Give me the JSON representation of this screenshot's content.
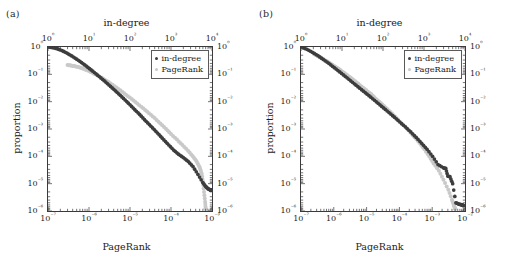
{
  "figure": {
    "background": "#ffffff",
    "series_colors": {
      "in_degree": "#3d3d3d",
      "pagerank": "#c9c9c9"
    }
  },
  "panels": [
    {
      "tag": "(a)",
      "axes": {
        "top_title": "in-degree",
        "bottom_title": "PageRank",
        "left_title": "proportion",
        "xtop_ticks": [
          "10⁰",
          "10¹",
          "10²",
          "10³",
          "10⁴"
        ],
        "xtop_exponents": [
          0,
          1,
          2,
          3,
          4
        ],
        "xbot_ticks": [
          "10⁻⁷",
          "10⁻⁶",
          "10⁻⁵",
          "10⁻⁴",
          "10⁻³"
        ],
        "xbot_exponents": [
          -7,
          -6,
          -5,
          -4,
          -3
        ],
        "y_ticks": [
          "10⁰",
          "10⁻¹",
          "10⁻²",
          "10⁻³",
          "10⁻⁴",
          "10⁻⁵",
          "10⁻⁶"
        ],
        "y_exponents": [
          0,
          -1,
          -2,
          -3,
          -4,
          -5,
          -6
        ]
      },
      "legend": {
        "items": [
          {
            "label": "in-degree",
            "color": "#3d3d3d"
          },
          {
            "label": "PageRank",
            "color": "#c9c9c9"
          }
        ]
      }
    },
    {
      "tag": "(b)",
      "axes": {
        "top_title": "in-degree",
        "bottom_title": "PageRank",
        "left_title": "proportion",
        "xtop_ticks": [
          "10⁰",
          "10¹",
          "10²",
          "10³",
          "10⁴"
        ],
        "xtop_exponents": [
          0,
          1,
          2,
          3,
          4
        ],
        "xbot_ticks": [
          "10⁻⁷",
          "10⁻⁶",
          "10⁻⁵",
          "10⁻⁴",
          "10⁻³",
          "10⁻²"
        ],
        "xbot_exponents": [
          -7,
          -6,
          -5,
          -4,
          -3,
          -2
        ],
        "y_ticks": [
          "10⁰",
          "10⁻¹",
          "10⁻²",
          "10⁻³",
          "10⁻⁴",
          "10⁻⁵",
          "10⁻⁶"
        ],
        "y_exponents": [
          0,
          -1,
          -2,
          -3,
          -4,
          -5,
          -6
        ]
      },
      "legend": {
        "items": [
          {
            "label": "in-degree",
            "color": "#3d3d3d"
          },
          {
            "label": "PageRank",
            "color": "#c9c9c9"
          }
        ]
      }
    }
  ],
  "chart_data": [
    {
      "type": "scatter",
      "panel": "(a)",
      "title": "",
      "xlabel": "PageRank",
      "xlabel_top": "in-degree",
      "ylabel": "proportion",
      "xscale": "log",
      "yscale": "log",
      "grid": false,
      "legend_position": "top-right",
      "xlim_top": [
        1,
        10000
      ],
      "xlim_bottom": [
        1e-07,
        0.001
      ],
      "ylim": [
        1e-06,
        1
      ],
      "series": [
        {
          "name": "in-degree",
          "color": "#3d3d3d",
          "axis": "top",
          "x": [
            1,
            1.3,
            1.7,
            2.2,
            2.9,
            3.8,
            5,
            6.6,
            8.6,
            11.3,
            14.8,
            19.5,
            25.6,
            33.6,
            44.1,
            58,
            76.1,
            100,
            131,
            172,
            226,
            297,
            390,
            512,
            672,
            883,
            1160,
            1523,
            2000,
            2627,
            3450,
            4530,
            5950,
            7000,
            8000,
            9000,
            9500
          ],
          "y": [
            1.0,
            0.95,
            0.86,
            0.74,
            0.6,
            0.47,
            0.36,
            0.27,
            0.2,
            0.145,
            0.105,
            0.074,
            0.052,
            0.036,
            0.025,
            0.017,
            0.0115,
            0.0077,
            0.0051,
            0.0034,
            0.0022,
            0.00145,
            0.00095,
            0.00062,
            0.0004,
            0.00026,
            0.00017,
            0.00012,
            9e-05,
            6.5e-05,
            4.2e-05,
            2.2e-05,
            1.1e-05,
            8e-06,
            6.5e-06,
            6e-06,
            5.8e-06
          ]
        },
        {
          "name": "PageRank",
          "color": "#c9c9c9",
          "axis": "bottom",
          "x": [
            3e-07,
            3.6e-07,
            4.4e-07,
            5.5e-07,
            7e-07,
            9e-07,
            1.2e-06,
            1.6e-06,
            2.2e-06,
            3e-06,
            4.2e-06,
            5.8e-06,
            8e-06,
            1.1e-05,
            1.5e-05,
            2.1e-05,
            2.9e-05,
            4e-05,
            5.5e-05,
            7.5e-05,
            0.0001,
            0.00014,
            0.00019,
            0.00026,
            0.00034,
            0.00042,
            0.0005,
            0.00056,
            0.0006,
            0.00064,
            0.00068,
            0.0007
          ],
          "y": [
            0.22,
            0.21,
            0.2,
            0.185,
            0.165,
            0.14,
            0.115,
            0.09,
            0.07,
            0.052,
            0.037,
            0.026,
            0.018,
            0.0125,
            0.0085,
            0.0057,
            0.0038,
            0.0025,
            0.0016,
            0.00102,
            0.00065,
            0.00041,
            0.00026,
            0.00016,
            0.0001,
            6.6e-05,
            4e-05,
            2.3e-05,
            1.2e-05,
            5e-06,
            2.2e-06,
            1.2e-06
          ]
        }
      ]
    },
    {
      "type": "scatter",
      "panel": "(b)",
      "title": "",
      "xlabel": "PageRank",
      "xlabel_top": "in-degree",
      "ylabel": "proportion",
      "xscale": "log",
      "yscale": "log",
      "grid": false,
      "legend_position": "top-right",
      "xlim_top": [
        1,
        10000
      ],
      "xlim_bottom": [
        1e-07,
        0.01
      ],
      "ylim": [
        1e-06,
        1
      ],
      "series": [
        {
          "name": "in-degree",
          "color": "#3d3d3d",
          "axis": "top",
          "x": [
            1,
            1.4,
            1.9,
            2.6,
            3.5,
            4.8,
            6.5,
            8.8,
            12,
            16.3,
            22,
            30,
            41,
            56,
            76,
            103,
            140,
            190,
            258,
            350,
            476,
            646,
            878,
            1193,
            1620,
            2200,
            2990,
            3400,
            3800,
            4300,
            5000,
            6000,
            7000,
            8000,
            9000
          ],
          "y": [
            1.0,
            0.82,
            0.64,
            0.48,
            0.35,
            0.25,
            0.175,
            0.122,
            0.084,
            0.058,
            0.04,
            0.0275,
            0.0188,
            0.0128,
            0.0087,
            0.0059,
            0.004,
            0.0027,
            0.0018,
            0.0012,
            0.00078,
            0.00049,
            0.0003,
            0.00018,
            0.0001,
            5e-05,
            3.8e-05,
            3.6e-05,
            1.9e-05,
            1.8e-05,
            1e-05,
            2e-06,
            1.8e-06,
            1.7e-06,
            1.6e-06
          ]
        },
        {
          "name": "PageRank",
          "color": "#c9c9c9",
          "axis": "bottom",
          "x": [
            2.5e-07,
            3.2e-07,
            4.2e-07,
            5.6e-07,
            7.5e-07,
            1e-06,
            1.4e-06,
            1.9e-06,
            2.6e-06,
            3.6e-06,
            5e-06,
            7e-06,
            9.8e-06,
            1.4e-05,
            1.9e-05,
            2.7e-05,
            3.8e-05,
            5.3e-05,
            7.4e-05,
            0.0001,
            0.00015,
            0.00021,
            0.00029,
            0.00041,
            0.00058,
            0.00081,
            0.0011,
            0.0016,
            0.0022,
            0.0031,
            0.004,
            0.0046,
            0.005
          ],
          "y": [
            0.55,
            0.47,
            0.39,
            0.32,
            0.26,
            0.205,
            0.16,
            0.122,
            0.092,
            0.069,
            0.05,
            0.036,
            0.026,
            0.0185,
            0.0128,
            0.0089,
            0.0061,
            0.0042,
            0.0028,
            0.0019,
            0.0012,
            0.00078,
            0.0005,
            0.00031,
            0.00018,
            0.0001,
            5.5e-05,
            3e-05,
            1.4e-05,
            6e-06,
            2.6e-06,
            1.6e-06,
            1.2e-06
          ]
        }
      ]
    }
  ]
}
